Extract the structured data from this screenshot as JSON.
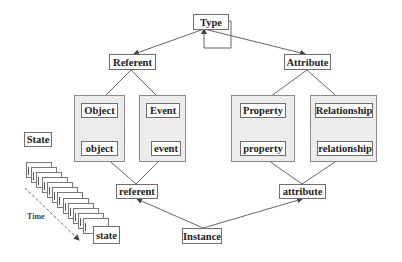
{
  "diagram": {
    "nodes": {
      "type": "Type",
      "referent_type": "Referent",
      "attribute_type": "Attribute",
      "object_type": "Object",
      "event_type": "Event",
      "property_type": "Property",
      "relationship_type": "Relationship",
      "object_instance": "object",
      "event_instance": "event",
      "property_instance": "property",
      "relationship_instance": "relationship",
      "referent_instance": "referent",
      "attribute_instance": "attribute",
      "instance": "Instance",
      "state_label": "State",
      "state_instance": "state",
      "time_label": "Time"
    },
    "edges": [
      {
        "from": "Type",
        "to": "Referent"
      },
      {
        "from": "Type",
        "to": "Attribute"
      },
      {
        "from": "Type",
        "to": "Type",
        "kind": "self-loop"
      },
      {
        "from": "Referent",
        "to": "Object"
      },
      {
        "from": "Referent",
        "to": "Event"
      },
      {
        "from": "Attribute",
        "to": "Property"
      },
      {
        "from": "Attribute",
        "to": "Relationship"
      },
      {
        "from": "referent",
        "to": "object"
      },
      {
        "from": "referent",
        "to": "event"
      },
      {
        "from": "attribute",
        "to": "property"
      },
      {
        "from": "attribute",
        "to": "relationship"
      },
      {
        "from": "Instance",
        "to": "referent"
      },
      {
        "from": "Instance",
        "to": "attribute"
      }
    ],
    "state_stack_count": 12,
    "colors": {
      "group_fill": "#ececec",
      "line": "#555555",
      "border": "#6e6e6e"
    }
  }
}
